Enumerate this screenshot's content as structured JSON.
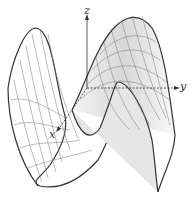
{
  "figure": {
    "type": "3d-surface-mesh",
    "axes": {
      "x_label": "x",
      "y_label": "y",
      "z_label": "z"
    },
    "colors": {
      "mesh": "#555555",
      "outline": "#333333",
      "shade": "#cfcfcf",
      "axis": "#333333"
    }
  }
}
